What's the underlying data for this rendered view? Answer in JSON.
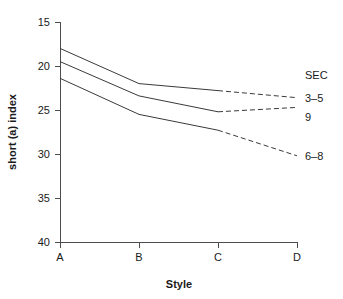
{
  "chart_data": {
    "type": "line",
    "title": "",
    "xlabel": "Style",
    "ylabel": "short (a) index",
    "categories": [
      "A",
      "B",
      "C",
      "D"
    ],
    "x_tick_labels": [
      "A",
      "B",
      "C",
      "D"
    ],
    "y_tick_labels": [
      "15",
      "20",
      "25",
      "30",
      "35",
      "40"
    ],
    "y_ticks": [
      15,
      20,
      25,
      30,
      35,
      40
    ],
    "ylim": [
      15,
      40
    ],
    "y_axis_inverted": true,
    "grid": false,
    "legend_title": "SEC",
    "legend_position": "right",
    "series": [
      {
        "name": "3-5",
        "label": "3–5",
        "values": [
          18.0,
          22.0,
          22.8,
          23.6
        ],
        "solid_segment": [
          "A",
          "B",
          "C"
        ],
        "dashed_segment": [
          "C",
          "D"
        ]
      },
      {
        "name": "9",
        "label": "9",
        "values": [
          19.5,
          23.4,
          25.2,
          24.7
        ],
        "solid_segment": [
          "A",
          "B",
          "C"
        ],
        "dashed_segment": [
          "C",
          "D"
        ]
      },
      {
        "name": "6-8",
        "label": "6–8",
        "values": [
          21.4,
          25.5,
          27.3,
          30.2
        ],
        "solid_segment": [
          "A",
          "B",
          "C"
        ],
        "dashed_segment": [
          "C",
          "D"
        ]
      }
    ]
  },
  "axes": {
    "y_title": "short (a) index",
    "x_title": "Style",
    "y_tick_0": "15",
    "y_tick_1": "20",
    "y_tick_2": "25",
    "y_tick_3": "30",
    "y_tick_4": "35",
    "y_tick_5": "40",
    "x_tick_0": "A",
    "x_tick_1": "B",
    "x_tick_2": "C",
    "x_tick_3": "D"
  },
  "legend": {
    "title": "SEC",
    "entry_0": "3–5",
    "entry_1": "9",
    "entry_2": "6–8"
  },
  "colors": {
    "line": "#3a3a3a",
    "axis": "#4d4d4d",
    "text": "#1a1a1a",
    "background": "#ffffff"
  }
}
